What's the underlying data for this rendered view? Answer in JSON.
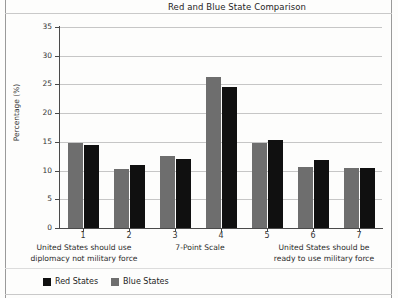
{
  "chart_data": {
    "type": "bar",
    "title": "Red and Blue State Comparison",
    "xlabel": "7-Point Scale",
    "ylabel": "Percentage (%)",
    "categories": [
      "1",
      "2",
      "3",
      "4",
      "5",
      "6",
      "7"
    ],
    "ylim": [
      0,
      35
    ],
    "yticks": [
      "0",
      "5",
      "10",
      "15",
      "20",
      "25",
      "30",
      "35"
    ],
    "grid": true,
    "legend_position": "bottom-left",
    "series": [
      {
        "name": "Blue States",
        "color": "#6e6e6e",
        "values": [
          14.8,
          10.2,
          12.6,
          26.3,
          14.8,
          10.7,
          10.4
        ]
      },
      {
        "name": "Red States",
        "color": "#101010",
        "values": [
          14.4,
          11.0,
          12.1,
          24.5,
          15.3,
          11.9,
          10.4
        ]
      }
    ],
    "annotations": {
      "left_anchor": "United States should use diplomacy not military force",
      "center_anchor": "7-Point Scale",
      "right_anchor": "United States should be ready to use military force"
    }
  },
  "captions": {
    "left_line1": "United States should use",
    "left_line2": "diplomacy not military force",
    "middle": "7-Point Scale",
    "right_line1": "United States should be",
    "right_line2": "ready to use military force"
  },
  "legend": {
    "items": [
      {
        "label": "Red States",
        "color": "#101010"
      },
      {
        "label": "Blue States",
        "color": "#6e6e6e"
      }
    ]
  }
}
